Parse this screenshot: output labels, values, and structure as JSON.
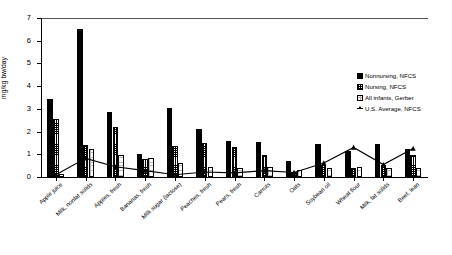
{
  "chart_data": {
    "type": "bar",
    "title": "",
    "xlabel": "",
    "ylabel": "mg/kg bw/day",
    "ylim": [
      0,
      7
    ],
    "yticks": [
      0,
      1,
      2,
      3,
      4,
      5,
      6,
      7
    ],
    "grid": false,
    "legend_position": "right",
    "categories": [
      "Apple juice",
      "Milk, nonfat solids",
      "Apples, fresh",
      "Bananas, fresh",
      "Milk sugar (lactose)",
      "Peaches, fresh",
      "Pears, fresh",
      "Carrots",
      "Oats",
      "Soybean oil",
      "Wheat flour",
      "Milk, fat solids",
      "Beef, lean"
    ],
    "series": [
      {
        "name": "Nonnursing, NFCS",
        "type": "bar",
        "marker": "solid-black-square",
        "values": [
          3.45,
          6.5,
          2.85,
          1.02,
          3.05,
          2.1,
          1.6,
          1.55,
          0.72,
          1.45,
          1.15,
          1.45,
          1.25
        ]
      },
      {
        "name": "Nursing, NFCS",
        "type": "bar",
        "marker": "checkered-square",
        "values": [
          2.55,
          1.42,
          2.2,
          0.8,
          1.35,
          1.5,
          1.3,
          0.95,
          0.22,
          0.52,
          0.4,
          0.55,
          0.95
        ]
      },
      {
        "name": "All infants, Gerber",
        "type": "bar",
        "marker": "dotted-square",
        "values": [
          0.12,
          1.25,
          0.98,
          0.82,
          0.62,
          0.45,
          0.38,
          0.42,
          0.3,
          0.4,
          0.42,
          0.38,
          0.4
        ]
      },
      {
        "name": "U.S. Average, NFCS",
        "type": "line",
        "marker": "star",
        "values": [
          0.1,
          0.82,
          0.45,
          0.28,
          0.1,
          0.22,
          0.18,
          0.28,
          0.2,
          0.62,
          1.3,
          0.55,
          1.25
        ]
      }
    ]
  },
  "legend": {
    "items": [
      {
        "label": "Nonnursing, NFCS"
      },
      {
        "label": "Nursing, NFCS"
      },
      {
        "label": "All infants, Gerber"
      },
      {
        "label": "U.S. Average, NFCS"
      }
    ]
  }
}
